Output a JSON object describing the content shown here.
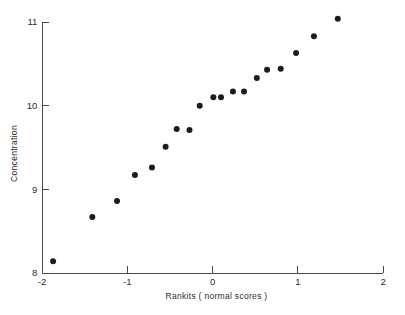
{
  "chart_data": {
    "type": "scatter",
    "title": "",
    "subtitle": "",
    "xlabel": "Rankits ( normal scores )",
    "ylabel": "Concentration",
    "xlim": [
      -2,
      2
    ],
    "ylim": [
      8,
      11
    ],
    "xticks": [
      -2,
      -1,
      0,
      1,
      2
    ],
    "xtick_labels": [
      "-2",
      "-1",
      "0",
      "1",
      "2"
    ],
    "yticks": [
      8,
      9,
      10,
      11
    ],
    "ytick_labels": [
      "8",
      "9",
      "10",
      "11"
    ],
    "grid": false,
    "legend": null,
    "legend_position": "none",
    "annotations": [],
    "marker": "filled-circle",
    "marker_color": "#1c1c1c",
    "marker_size": 3,
    "n_points": 19,
    "x": [
      -1.87,
      -1.41,
      -1.12,
      -0.91,
      -0.71,
      -0.55,
      -0.42,
      -0.27,
      -0.15,
      0.01,
      0.1,
      0.24,
      0.37,
      0.52,
      0.64,
      0.8,
      0.98,
      1.19,
      1.47
    ],
    "y": [
      8.14,
      8.67,
      8.86,
      9.17,
      9.26,
      9.51,
      9.72,
      9.71,
      10.0,
      10.1,
      10.1,
      10.17,
      10.17,
      10.33,
      10.43,
      10.44,
      10.63,
      10.83,
      11.04
    ],
    "points": [
      {
        "x": -1.87,
        "y": 8.14
      },
      {
        "x": -1.41,
        "y": 8.67
      },
      {
        "x": -1.12,
        "y": 8.86
      },
      {
        "x": -0.91,
        "y": 9.17
      },
      {
        "x": -0.71,
        "y": 9.26
      },
      {
        "x": -0.55,
        "y": 9.51
      },
      {
        "x": -0.42,
        "y": 9.72
      },
      {
        "x": -0.27,
        "y": 9.71
      },
      {
        "x": -0.15,
        "y": 10.0
      },
      {
        "x": 0.01,
        "y": 10.1
      },
      {
        "x": 0.1,
        "y": 10.1
      },
      {
        "x": 0.24,
        "y": 10.17
      },
      {
        "x": 0.37,
        "y": 10.17
      },
      {
        "x": 0.52,
        "y": 10.33
      },
      {
        "x": 0.64,
        "y": 10.43
      },
      {
        "x": 0.8,
        "y": 10.44
      },
      {
        "x": 0.98,
        "y": 10.63
      },
      {
        "x": 1.19,
        "y": 10.83
      },
      {
        "x": 1.47,
        "y": 11.04
      }
    ]
  },
  "colors": {
    "axis": "#4a4a4a",
    "text": "#2b2b2b",
    "marker": "#1c1c1c",
    "background": "#ffffff"
  }
}
